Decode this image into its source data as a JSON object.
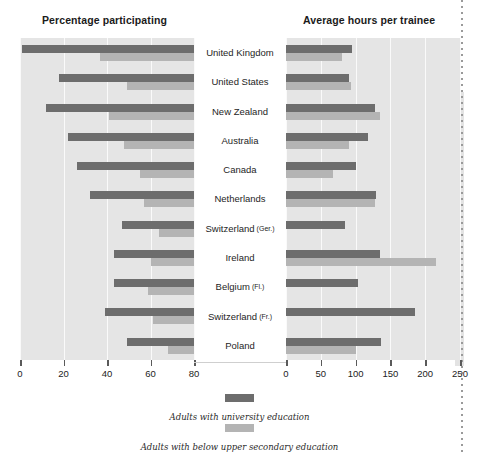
{
  "chart_data": {
    "type": "bar",
    "title": "",
    "orientation": "horizontal-butterfly",
    "categories": [
      "United Kingdom",
      "United States",
      "New Zealand",
      "Australia",
      "Canada",
      "Netherlands",
      "Switzerland (Ger.)",
      "Ireland",
      "Belgium (Fl.)",
      "Switzerland (Fr.)",
      "Poland"
    ],
    "panels": [
      {
        "id": "left",
        "title": "Percentage participating",
        "xlabel": "",
        "ylabel": "",
        "xlim": [
          80,
          0
        ],
        "reversed": true,
        "ticks": [
          80,
          60,
          40,
          20,
          0
        ],
        "grid": true,
        "series": [
          {
            "name": "Adults with university education",
            "color": "#6d6d6d",
            "values": [
              79,
              62,
              68,
              58,
              54,
              48,
              33,
              37,
              37,
              41,
              31
            ]
          },
          {
            "name": "Adults with below upper secondary education",
            "color": "#b4b4b4",
            "values": [
              43,
              31,
              39,
              32,
              25,
              23,
              16,
              20,
              21,
              19,
              12
            ]
          }
        ]
      },
      {
        "id": "right",
        "title": "Average hours per trainee",
        "xlabel": "",
        "ylabel": "",
        "xlim": [
          0,
          250
        ],
        "reversed": false,
        "ticks": [
          0,
          50,
          100,
          150,
          200,
          250
        ],
        "grid": true,
        "series": [
          {
            "name": "Adults with university education",
            "color": "#6d6d6d",
            "values": [
              95,
              90,
              128,
              118,
              100,
              130,
              85,
              135,
              103,
              185,
              137
            ]
          },
          {
            "name": "Adults with below upper secondary education",
            "color": "#b4b4b4",
            "values": [
              80,
              94,
              135,
              91,
              67,
              128,
              0,
              215,
              0,
              0,
              100
            ]
          }
        ]
      }
    ],
    "legend": {
      "position": "bottom",
      "entries": [
        {
          "label": "Adults with university education",
          "color": "#6d6d6d"
        },
        {
          "label": "Adults with below upper secondary education",
          "color": "#b4b4b4"
        }
      ]
    }
  },
  "colors": {
    "dark_series": "#6d6d6d",
    "light_series": "#b4b4b4",
    "plot_background": "#e5e5e5",
    "gridline": "#fafafa",
    "page_background": "#ffffff"
  }
}
